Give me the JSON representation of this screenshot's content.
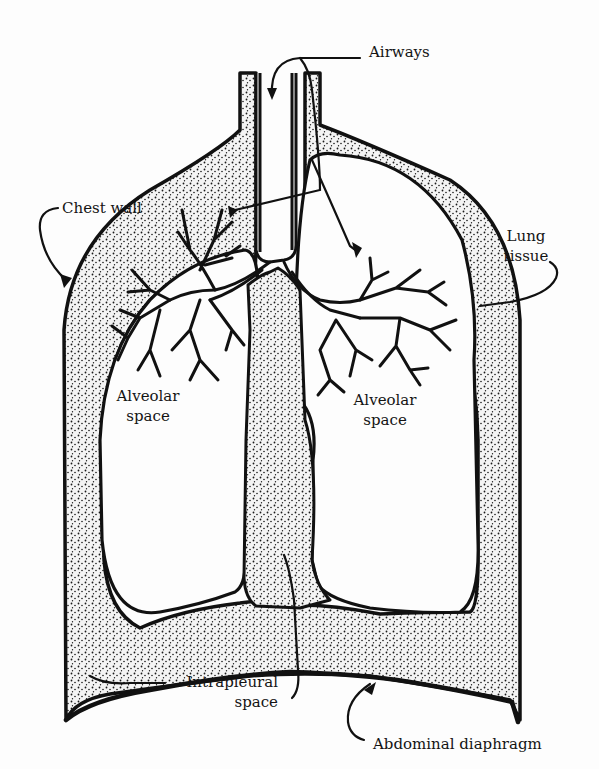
{
  "diagram": {
    "colors": {
      "background": "#fdfdfd",
      "outline": "#111111",
      "stipple_fill": "#e9e9e9",
      "stipple_dot": "#1a1a1a",
      "text": "#141414"
    },
    "labels": {
      "airways": "Airways",
      "chest_wall": "Chest wall",
      "lung_tissue_line1": "Lung",
      "lung_tissue_line2": "tissue",
      "alveolar_left_line1": "Alveolar",
      "alveolar_left_line2": "space",
      "alveolar_right_line1": "Alveolar",
      "alveolar_right_line2": "space",
      "intrapleural_line1": "Intrapleural",
      "intrapleural_line2": "space",
      "abdominal_diaphragm": "Abdominal diaphragm"
    }
  }
}
